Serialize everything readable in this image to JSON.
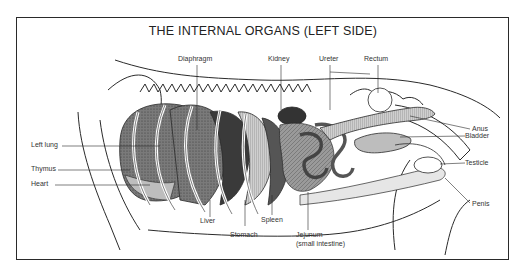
{
  "diagram": {
    "title": "THE INTERNAL ORGANS (LEFT SIDE)",
    "labels": {
      "diaphragm": "Diaphragm",
      "kidney": "Kidney",
      "ureter": "Ureter",
      "rectum": "Rectum",
      "anus": "Anus",
      "bladder": "Bladder",
      "testicle": "Testicle",
      "penis": "Penis",
      "left_lung": "Left lung",
      "thymus": "Thymus",
      "heart": "Heart",
      "liver": "Liver",
      "stomach": "Stomach",
      "spleen": "Spleen",
      "jejunum": "Jejunum",
      "jejunum_note": "(small intestine)"
    },
    "colors": {
      "line": "#2a2a2a",
      "organ_dark": "#3a3a3a",
      "organ_mid": "#8a8a8a",
      "organ_light": "#bdbdbd"
    }
  }
}
